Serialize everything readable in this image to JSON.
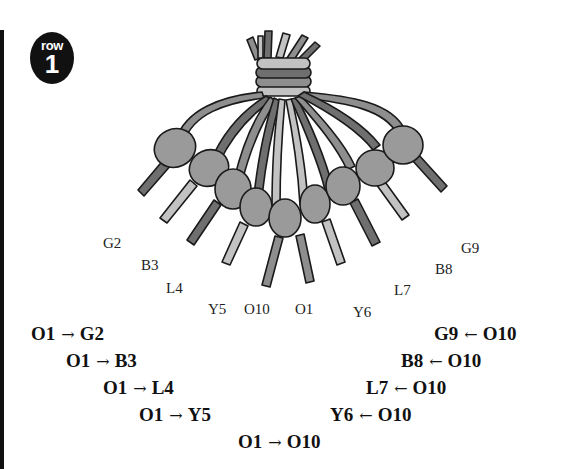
{
  "badge": {
    "word": "row",
    "number": "1"
  },
  "colors": {
    "dark_strand": "#6f6f6f",
    "mid_strand": "#8e8e8e",
    "light_strand": "#c2c2c2",
    "knot": "#9a9a9a",
    "outline": "#1a1a1a"
  },
  "strand_labels": {
    "left": [
      {
        "id": "G2",
        "text": "G2"
      },
      {
        "id": "B3",
        "text": "B3"
      },
      {
        "id": "L4",
        "text": "L4"
      },
      {
        "id": "Y5",
        "text": "Y5"
      },
      {
        "id": "O10",
        "text": "O10"
      }
    ],
    "right": [
      {
        "id": "O1",
        "text": "O1"
      },
      {
        "id": "Y6",
        "text": "Y6"
      },
      {
        "id": "L7",
        "text": "L7"
      },
      {
        "id": "B8",
        "text": "B8"
      },
      {
        "id": "G9",
        "text": "G9"
      }
    ]
  },
  "instructions": {
    "left": [
      {
        "from": "O1",
        "arrow": "→",
        "to": "G2"
      },
      {
        "from": "O1",
        "arrow": "→",
        "to": "B3"
      },
      {
        "from": "O1",
        "arrow": "→",
        "to": "L4"
      },
      {
        "from": "O1",
        "arrow": "→",
        "to": "Y5"
      }
    ],
    "right": [
      {
        "to": "G9",
        "arrow": "←",
        "from": "O10"
      },
      {
        "to": "B8",
        "arrow": "←",
        "from": "O10"
      },
      {
        "to": "L7",
        "arrow": "←",
        "from": "O10"
      },
      {
        "to": "Y6",
        "arrow": "←",
        "from": "O10"
      }
    ],
    "center": {
      "from": "O1",
      "arrow": "→",
      "to": "O10"
    }
  }
}
